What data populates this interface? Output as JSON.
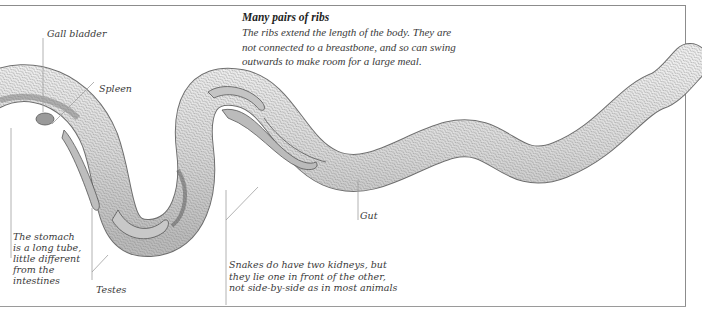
{
  "figure": {
    "heading": "Many pairs of ribs",
    "caption_lines": [
      "The ribs extend the length of the body. They are",
      "not connected to a breastbone, and so can swing",
      "outwards to make room for a large meal."
    ]
  },
  "labels": {
    "gall_bladder": "Gall bladder",
    "spleen": "Spleen",
    "gut": "Gut",
    "testes": "Testes",
    "stomach": [
      "The stomach",
      "is a long tube,",
      "little different",
      "from the",
      "intestines"
    ],
    "kidneys": [
      "Snakes do have two kidneys, but",
      "they lie one in front of the other,",
      "not side-by-side as in most animals"
    ]
  },
  "colors": {
    "rule": "#8c8c8c",
    "skin_light": "#ececec",
    "skin_mid": "#c9c9c9",
    "scale_line": "#6a6a6a",
    "organ": "#b8b8b8",
    "leader": "#9a9a9a",
    "text": "#3a3a3a"
  }
}
